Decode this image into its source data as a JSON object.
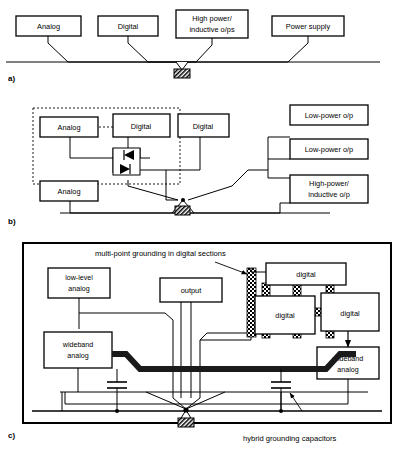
{
  "figure": {
    "sections": [
      {
        "id": "a",
        "label": "a)"
      },
      {
        "id": "b",
        "label": "b)"
      },
      {
        "id": "c",
        "label": "c)"
      }
    ]
  },
  "section_a": {
    "label": "a)",
    "boxes": [
      {
        "name": "analog",
        "lines": [
          "Analog"
        ]
      },
      {
        "name": "digital",
        "lines": [
          "Digital"
        ]
      },
      {
        "name": "high-power",
        "lines": [
          "High power/",
          "inductive o/ps"
        ]
      },
      {
        "name": "power-supply",
        "lines": [
          "Power supply"
        ]
      }
    ],
    "ground_symbol": "chassis-ground"
  },
  "section_b": {
    "label": "b)",
    "boxes": [
      {
        "name": "analog-top",
        "lines": [
          "Analog"
        ]
      },
      {
        "name": "digital-left",
        "lines": [
          "Digital"
        ]
      },
      {
        "name": "digital-right",
        "lines": [
          "Digital"
        ]
      },
      {
        "name": "analog-bottom",
        "lines": [
          "Analog"
        ]
      },
      {
        "name": "low-power-op-1",
        "lines": [
          "Low-power o/p"
        ]
      },
      {
        "name": "low-power-op-2",
        "lines": [
          "Low-power o/p"
        ]
      },
      {
        "name": "high-power-op",
        "lines": [
          "High-power/",
          "inductive o/p"
        ]
      }
    ],
    "component": "back-to-back-diodes",
    "dashed_enclosure": "sub-assembly-boundary",
    "ground_symbol": "chassis-ground"
  },
  "section_c": {
    "label": "c)",
    "boxes": [
      {
        "name": "low-level-analog",
        "lines": [
          "low-level",
          "analog"
        ]
      },
      {
        "name": "wideband-analog-left",
        "lines": [
          "wideband",
          "analog"
        ]
      },
      {
        "name": "output",
        "lines": [
          "output"
        ]
      },
      {
        "name": "digital-top",
        "lines": [
          "digital"
        ]
      },
      {
        "name": "digital-mid",
        "lines": [
          "digital"
        ]
      },
      {
        "name": "digital-right",
        "lines": [
          "digital"
        ]
      },
      {
        "name": "wideband-analog-right",
        "lines": [
          "wideband",
          "analog"
        ]
      }
    ],
    "annotations": [
      {
        "name": "multi-point-note",
        "text": "multi-point grounding in digital sections"
      },
      {
        "name": "hybrid-caps-note",
        "text": "hybrid grounding capacitors"
      }
    ],
    "ground_symbol": "chassis-ground",
    "bus": "heavy-ground-plane-bus",
    "strap_pattern": "checkerboard-bond-strap",
    "capacitors": 2
  },
  "colors": {
    "line": "#000000",
    "fill": "#ffffff",
    "bus": "#1a1a1a"
  }
}
